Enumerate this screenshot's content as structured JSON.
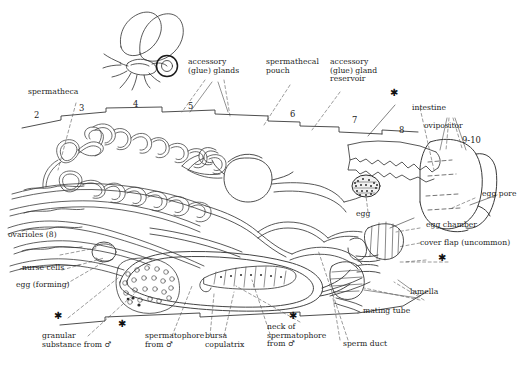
{
  "figure": {
    "type": "labelled-anatomical-diagram",
    "ink_color": "#1a1a1a",
    "background_color": "#ffffff",
    "line_color": "#3a3a3a"
  },
  "inset": {
    "name": "moth-insect-habitus",
    "description": "small drawing of a winged insect with circled abdomen tip"
  },
  "segment_numbers": [
    {
      "label": "2",
      "x": 34,
      "y": 115
    },
    {
      "label": "3",
      "x": 79,
      "y": 108
    },
    {
      "label": "4",
      "x": 133,
      "y": 104
    },
    {
      "label": "5",
      "x": 188,
      "y": 106
    },
    {
      "label": "6",
      "x": 290,
      "y": 114
    },
    {
      "label": "7",
      "x": 352,
      "y": 120
    },
    {
      "label": "8",
      "x": 399,
      "y": 130
    },
    {
      "label": "9-10",
      "x": 465,
      "y": 140
    }
  ],
  "labels": {
    "spermatheca": "spermatheca",
    "accessory_glue_glands": "accessory\n(glue) glands",
    "spermathecal_pouch": "spermathecal\npouch",
    "accessory_glue_gland_reservoir": "accessory\n(glue) gland\nreservoir",
    "intestine": "intestine",
    "ovipositor": "ovipositor",
    "egg_pore": "egg pore",
    "egg": "egg",
    "egg_chamber": "egg chamber",
    "cover_flap": "cover flap (uncommon)",
    "lamella": "lamella",
    "mating_tube": "mating tube",
    "sperm_duct": "sperm duct",
    "neck_of_spermatophore": "neck of\nspermatophore\nfrom ♂",
    "bursa_copulatrix": "bursa\ncopulatrix",
    "spermatophore": "spermatophore\nfrom ♂",
    "granular_substance": "granular\nsubstance from ♂",
    "egg_forming": "egg (forming)",
    "nurse_cells": "nurse cells",
    "ovarioles": "ovarioles (8)"
  },
  "markers": {
    "asterisk": "✱",
    "asterisk_positions": [
      {
        "x": 393,
        "y": 92
      },
      {
        "x": 441,
        "y": 258
      },
      {
        "x": 292,
        "y": 316
      },
      {
        "x": 121,
        "y": 324
      },
      {
        "x": 57,
        "y": 316
      }
    ]
  }
}
